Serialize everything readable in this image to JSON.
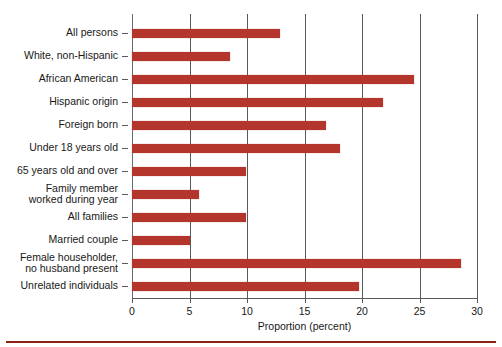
{
  "chart_data": {
    "type": "bar",
    "orientation": "horizontal",
    "title": "",
    "subtitle": "",
    "xlabel": "Proportion (percent)",
    "ylabel": "",
    "xlim": [
      0,
      30
    ],
    "xticks": [
      0,
      5,
      10,
      15,
      20,
      25,
      30
    ],
    "xtick_labels": [
      "0",
      "5",
      "10",
      "15",
      "20",
      "25",
      "30"
    ],
    "grid": true,
    "grid_axis": "x",
    "legend": false,
    "legend_position": "none",
    "bar_color": "#b4352b",
    "axis_color": "#5a5a5a",
    "categories": [
      "All persons",
      "White, non-Hispanic",
      "African American",
      "Hispanic origin",
      "Foreign born",
      "Under 18 years old",
      "65 years old and over",
      "Family member\nworked during year",
      "All families",
      "Married couple",
      "Female householder,\nno husband present",
      "Unrelated individuals"
    ],
    "values": [
      12.9,
      8.5,
      24.5,
      21.8,
      16.9,
      18.1,
      9.9,
      5.8,
      9.9,
      5.0,
      28.6,
      19.7
    ],
    "series": [
      {
        "name": "Proportion (percent)",
        "values": [
          12.9,
          8.5,
          24.5,
          21.8,
          16.9,
          18.1,
          9.9,
          5.8,
          9.9,
          5.0,
          28.6,
          19.7
        ]
      }
    ]
  }
}
